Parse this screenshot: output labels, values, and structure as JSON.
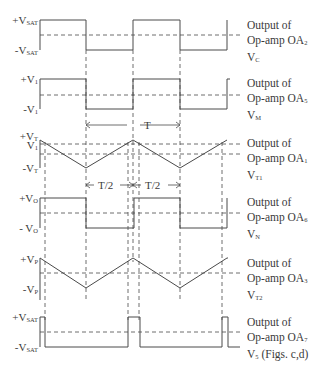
{
  "diagram": {
    "type": "timing-waveforms",
    "colors": {
      "line": "#4a4a4a",
      "background": "#ffffff",
      "text": "#3a3a3a"
    },
    "waveforms": [
      {
        "id": "vc",
        "y_labels": {
          "high": "+V",
          "high_sub": "SAT",
          "low": "-V",
          "low_sub": "SAT"
        },
        "caption": {
          "line1": "Output of",
          "line2": "Op-amp OA",
          "line2_sub": "2",
          "line3": "V",
          "line3_sub": "C"
        }
      },
      {
        "id": "vm",
        "y_labels": {
          "high": "+V",
          "high_sub": "1",
          "low": "-V",
          "low_sub": "1"
        },
        "caption": {
          "line1": "Output of",
          "line2": "Op-amp OA",
          "line2_sub": "5",
          "line3": "V",
          "line3_sub": "M"
        }
      },
      {
        "id": "vt1",
        "y_labels": {
          "high": "+V",
          "high_sub": "T",
          "mid": "V",
          "mid_sub": "1",
          "low": "-V",
          "low_sub": "T"
        },
        "caption": {
          "line1": "Output of",
          "line2": "Op-amp OA",
          "line2_sub": "1",
          "line3": "V",
          "line3_sub": "T1"
        }
      },
      {
        "id": "vn",
        "y_labels": {
          "high": "+V",
          "high_sub": "O",
          "low": "- V",
          "low_sub": "O"
        },
        "caption": {
          "line1": "Output of",
          "line2": "Op-amp OA",
          "line2_sub": "6",
          "line3": "V",
          "line3_sub": "N"
        }
      },
      {
        "id": "vt2",
        "y_labels": {
          "high": "+V",
          "high_sub": "P",
          "low": "-V",
          "low_sub": "P"
        },
        "caption": {
          "line1": "Output of",
          "line2": "Op-amp OA",
          "line2_sub": "3",
          "line3": "V",
          "line3_sub": "T2"
        }
      },
      {
        "id": "v5",
        "y_labels": {
          "high": "+V",
          "high_sub": "SAT",
          "low": "-V",
          "low_sub": "SAT"
        },
        "caption": {
          "line1": "Output of",
          "line2": "Op-amp OA",
          "line2_sub": "7",
          "line3": "V",
          "line3_sub": "5",
          "line3_suffix": " (Figs. c,d)"
        }
      }
    ],
    "annotations": {
      "period": "T",
      "half_period_left": "T/2",
      "half_period_right": "T/2"
    }
  }
}
